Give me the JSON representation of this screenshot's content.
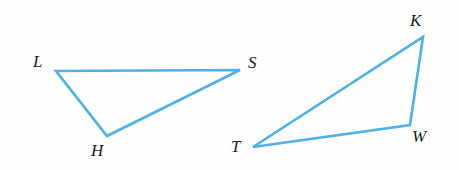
{
  "figure": {
    "background_color": "#fefefe",
    "stroke_color": "#4fb0e4",
    "stroke_width": 2.6,
    "label_color": "#1c1c1c",
    "width": 459,
    "height": 170,
    "shapes": [
      {
        "name": "triangle-LHS",
        "type": "triangle",
        "vertices": [
          {
            "label": "L",
            "x": 56,
            "y": 71,
            "label_x": 33,
            "label_y": 53
          },
          {
            "label": "S",
            "x": 240,
            "y": 70,
            "label_x": 248,
            "label_y": 54
          },
          {
            "label": "H",
            "x": 107,
            "y": 136,
            "label_x": 91,
            "label_y": 142
          }
        ],
        "points": "56,71 240,70 107,136"
      },
      {
        "name": "triangle-TWK",
        "type": "triangle",
        "vertices": [
          {
            "label": "T",
            "x": 253,
            "y": 147,
            "label_x": 231,
            "label_y": 138
          },
          {
            "label": "K",
            "x": 423,
            "y": 37,
            "label_x": 410,
            "label_y": 12
          },
          {
            "label": "W",
            "x": 410,
            "y": 125,
            "label_x": 412,
            "label_y": 128
          }
        ],
        "points": "253,147 423,37 410,125"
      }
    ]
  },
  "labels": {
    "L": "L",
    "S": "S",
    "H": "H",
    "T": "T",
    "K": "K",
    "W": "W"
  }
}
